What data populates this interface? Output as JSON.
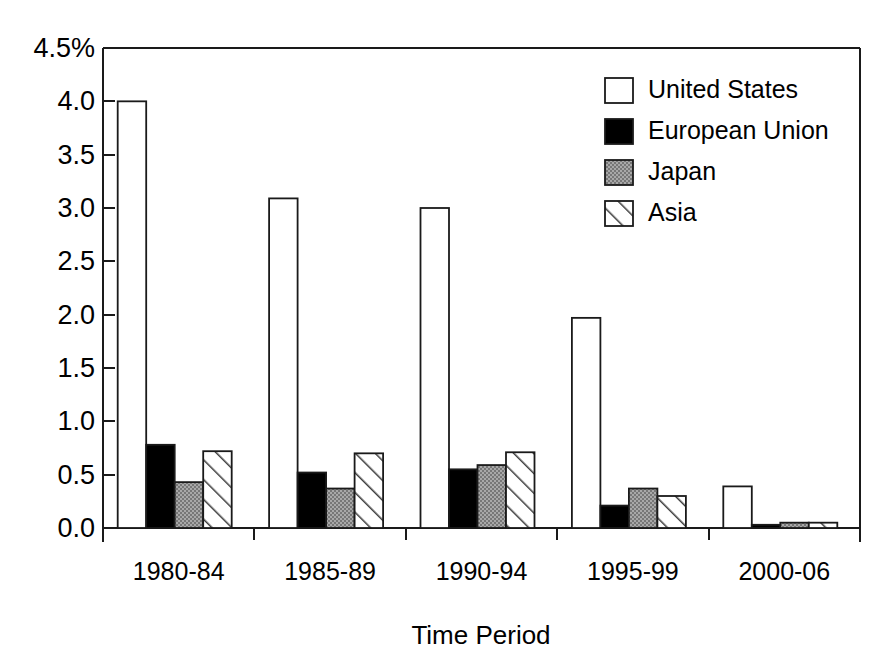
{
  "chart_data": {
    "type": "bar",
    "title": "",
    "xlabel": "Time Period",
    "ylabel": "",
    "categories": [
      "1980-84",
      "1985-89",
      "1990-94",
      "1995-99",
      "2000-06"
    ],
    "series": [
      {
        "name": "United States",
        "fill": "white",
        "values": [
          4.0,
          3.09,
          3.0,
          1.97,
          0.39
        ]
      },
      {
        "name": "European Union",
        "fill": "black",
        "values": [
          0.78,
          0.52,
          0.55,
          0.21,
          0.03
        ]
      },
      {
        "name": "Japan",
        "fill": "gray",
        "values": [
          0.43,
          0.37,
          0.59,
          0.37,
          0.05
        ]
      },
      {
        "name": "Asia",
        "fill": "hatch",
        "values": [
          0.72,
          0.7,
          0.71,
          0.3,
          0.05
        ]
      }
    ],
    "ylim": [
      0.0,
      4.5
    ],
    "ytick_values": [
      0.0,
      0.5,
      1.0,
      1.5,
      2.0,
      2.5,
      3.0,
      3.5,
      4.0,
      4.5
    ],
    "ytick_labels": [
      "0.0",
      "0.5",
      "1.0",
      "1.5",
      "2.0",
      "2.5",
      "3.0",
      "3.5",
      "4.0",
      "4.5%"
    ],
    "grid": false,
    "legend_position": "top-right"
  },
  "legend": {
    "entries": [
      {
        "label": "United States",
        "swatch": "white-square-icon"
      },
      {
        "label": "European Union",
        "swatch": "black-square-icon"
      },
      {
        "label": "Japan",
        "swatch": "gray-square-icon"
      },
      {
        "label": "Asia",
        "swatch": "hatched-square-icon"
      }
    ]
  },
  "colors": {
    "axis": "#1a1a1a",
    "united_states": "#ffffff",
    "european_union": "#000000",
    "japan": "#9a9a9a",
    "asia": "#ffffff",
    "background": "#ffffff"
  },
  "axis": {
    "x_title": "Time Period",
    "y_top_label": "4.5%"
  }
}
